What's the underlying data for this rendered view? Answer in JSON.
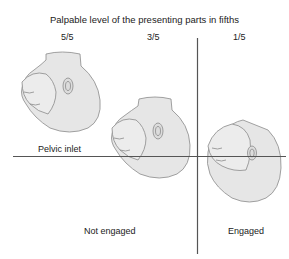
{
  "title": "Palpable level of the presenting parts in fifths",
  "levels": [
    {
      "label": "5/5"
    },
    {
      "label": "3/5"
    },
    {
      "label": "1/5"
    }
  ],
  "lines": {
    "pelvic_inlet_label": "Pelvic inlet"
  },
  "regions": {
    "not_engaged": "Not engaged",
    "engaged": "Engaged"
  },
  "colors": {
    "head_fill": "#e6e6e6",
    "outline": "#8a8a8a",
    "line": "#555555"
  }
}
